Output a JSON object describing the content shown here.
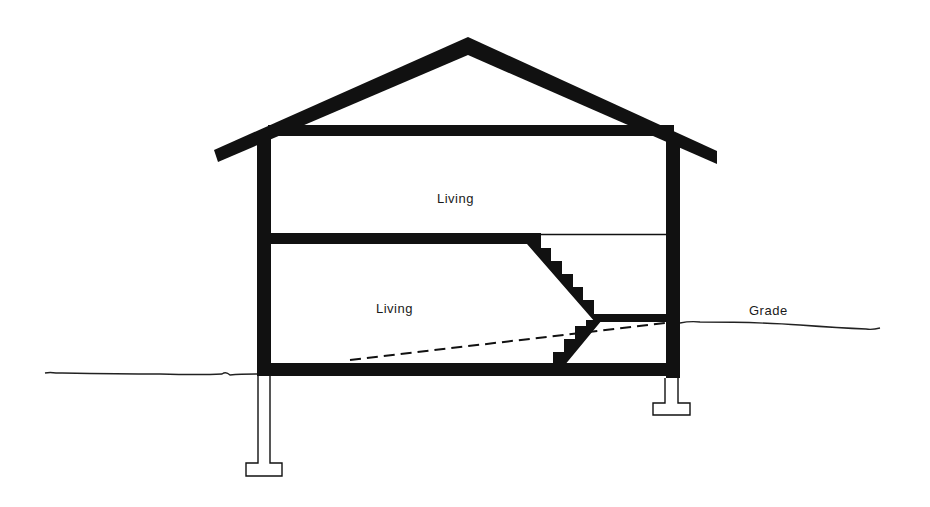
{
  "diagram": {
    "type": "building-section",
    "colors": {
      "structure": "#111111",
      "background": "#ffffff",
      "grade_line": "#222222",
      "text": "#1a1a1a"
    },
    "labels": {
      "upper_room": "Living",
      "lower_room": "Living",
      "grade": "Grade"
    },
    "elements": [
      "gable-roof",
      "attic-ceiling-joist",
      "upper-living-space",
      "mid-floor",
      "stair-flight-upper",
      "stair-landing",
      "stair-flight-lower",
      "lower-living-space",
      "dashed-grade-projection",
      "bottom-floor-slab",
      "left-wall",
      "right-wall",
      "left-footing",
      "right-footing",
      "grade-line-left",
      "grade-line-right"
    ]
  }
}
